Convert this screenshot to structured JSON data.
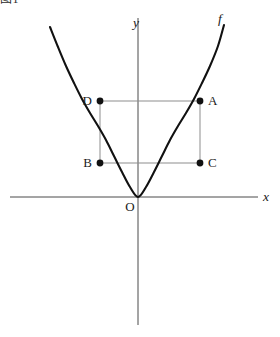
{
  "figure": {
    "corner_label": "图1",
    "background_color": "#ffffff",
    "curve_color": "#111111",
    "axis_color": "#4a4a4a",
    "helper_line_color": "#8d8d8d",
    "point_color": "#111111",
    "labels": {
      "y_axis": "y",
      "x_axis": "x",
      "function": "f",
      "origin": "O",
      "point_a": "A",
      "point_b": "B",
      "point_c": "C",
      "point_d": "D"
    }
  },
  "chart_data": {
    "type": "line",
    "title": "",
    "subtitle": "",
    "xlabel": "x",
    "ylabel": "y",
    "legend": [
      "f"
    ],
    "legend_position": "curve-end-top-right",
    "grid": false,
    "axes": {
      "x_axis_pixel_y": 197,
      "y_axis_pixel_x": 138,
      "x_axis_pixel_span": [
        10,
        258
      ],
      "y_axis_pixel_span": [
        18,
        325
      ],
      "origin_pixel": [
        138,
        197
      ],
      "arrowheads": false
    },
    "series": [
      {
        "name": "f",
        "type": "parabola",
        "description": "upward-opening parabola with vertex at the origin",
        "vertex": [
          0,
          0
        ],
        "pixel_points": [
          [
            50,
            27
          ],
          [
            58,
            47
          ],
          [
            66,
            66
          ],
          [
            74,
            83
          ],
          [
            82,
            99
          ],
          [
            90,
            113
          ],
          [
            98,
            126
          ],
          [
            106,
            140
          ],
          [
            114,
            156
          ],
          [
            122,
            172
          ],
          [
            130,
            187
          ],
          [
            138,
            197
          ],
          [
            146,
            187
          ],
          [
            154,
            172
          ],
          [
            162,
            156
          ],
          [
            170,
            140
          ],
          [
            178,
            126
          ],
          [
            186,
            113
          ],
          [
            194,
            99
          ],
          [
            202,
            83
          ],
          [
            210,
            66
          ],
          [
            218,
            46
          ],
          [
            224,
            25
          ]
        ]
      }
    ],
    "annotations": [
      {
        "label": "A",
        "pixel": [
          200,
          101
        ],
        "on_curve": true,
        "label_offset": [
          8,
          4
        ]
      },
      {
        "label": "B",
        "pixel": [
          100,
          163
        ],
        "on_curve": true,
        "label_offset": [
          -14,
          4
        ]
      },
      {
        "label": "C",
        "pixel": [
          200,
          163
        ],
        "on_curve": false,
        "label_offset": [
          8,
          4
        ]
      },
      {
        "label": "D",
        "pixel": [
          100,
          101
        ],
        "on_curve": false,
        "label_offset": [
          -14,
          4
        ]
      },
      {
        "label": "O",
        "pixel": [
          138,
          197
        ],
        "on_curve": true,
        "label_offset": [
          -12,
          13
        ]
      }
    ],
    "helper_segments": [
      {
        "name": "segment-DA",
        "from": [
          100,
          101
        ],
        "to": [
          200,
          101
        ]
      },
      {
        "name": "segment-BC",
        "from": [
          100,
          163
        ],
        "to": [
          200,
          163
        ]
      },
      {
        "name": "segment-DB",
        "from": [
          100,
          101
        ],
        "to": [
          100,
          163
        ]
      },
      {
        "name": "segment-AC",
        "from": [
          200,
          101
        ],
        "to": [
          200,
          163
        ]
      }
    ]
  }
}
